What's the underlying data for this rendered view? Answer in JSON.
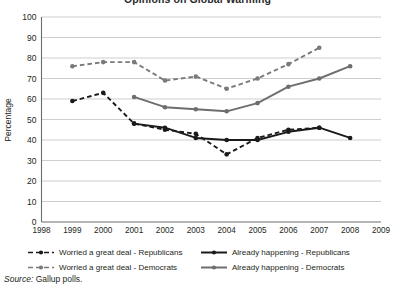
{
  "chart_data": {
    "type": "line",
    "title": "Opinions on Global Warming",
    "xlabel": "",
    "ylabel": "Percentage",
    "x": [
      1999,
      2000,
      2001,
      2002,
      2003,
      2004,
      2005,
      2006,
      2007,
      2008
    ],
    "xlim": [
      1998,
      2009
    ],
    "ylim": [
      0,
      100
    ],
    "xticks": [
      "1998",
      "1999",
      "2000",
      "2001",
      "2002",
      "2003",
      "2004",
      "2005",
      "2006",
      "2007",
      "2008",
      "2009"
    ],
    "yticks": [
      "0",
      "10",
      "20",
      "30",
      "40",
      "50",
      "60",
      "70",
      "80",
      "90",
      "100"
    ],
    "grid": "horizontal",
    "legend_position": "bottom",
    "series": [
      {
        "name": "Worried a great deal - Republicans",
        "color": "#1a1a1a",
        "style": "dashed",
        "marker": "circle",
        "x": [
          1999,
          2000,
          2001,
          2002,
          2003,
          2004,
          2005,
          2006,
          2007
        ],
        "values": [
          59,
          63,
          48,
          45,
          43,
          33,
          41,
          45,
          46
        ]
      },
      {
        "name": "Already happening - Republicans",
        "color": "#1a1a1a",
        "style": "solid",
        "marker": "circle",
        "x": [
          2001,
          2002,
          2003,
          2004,
          2005,
          2006,
          2007,
          2008
        ],
        "values": [
          48,
          46,
          41,
          40,
          40,
          44,
          46,
          41
        ]
      },
      {
        "name": "Worried a great deal - Democrats",
        "color": "#7a7a7a",
        "style": "dashed",
        "marker": "circle",
        "x": [
          1999,
          2000,
          2001,
          2002,
          2003,
          2004,
          2005,
          2006,
          2007
        ],
        "values": [
          76,
          78,
          78,
          69,
          71,
          65,
          70,
          77,
          85
        ]
      },
      {
        "name": "Already happening - Democrats",
        "color": "#6e6e6e",
        "style": "solid",
        "marker": "circle",
        "x": [
          2001,
          2002,
          2003,
          2004,
          2005,
          2006,
          2007,
          2008
        ],
        "values": [
          61,
          56,
          55,
          54,
          58,
          66,
          70,
          76
        ]
      }
    ]
  },
  "legend": {
    "items": [
      "Worried a great deal - Republicans",
      "Already happening - Republicans",
      "Worried a great deal - Democrats",
      "Already happening - Democrats"
    ]
  },
  "source": {
    "prefix": "Source:",
    "text": "Gallup polls."
  }
}
